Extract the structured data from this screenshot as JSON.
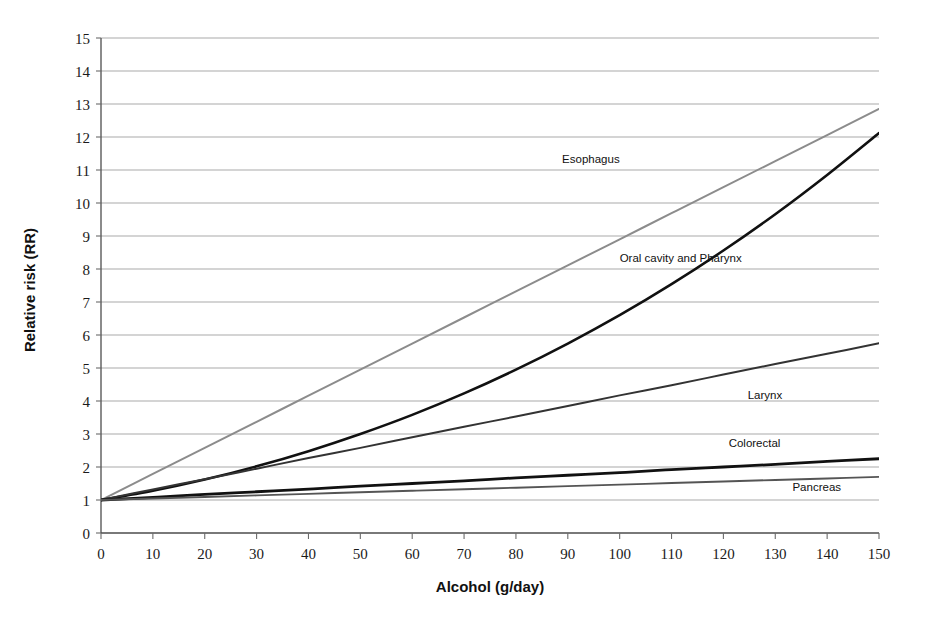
{
  "chart_data": {
    "type": "line",
    "title": "",
    "xlabel": "Alcohol (g/day)",
    "ylabel": "Relative risk (RR)",
    "xlim": [
      0,
      150
    ],
    "ylim": [
      0,
      15
    ],
    "xticks": [
      "0",
      "10",
      "20",
      "30",
      "40",
      "50",
      "60",
      "70",
      "80",
      "90",
      "100",
      "110",
      "120",
      "130",
      "140",
      "150"
    ],
    "yticks": [
      "0",
      "1",
      "2",
      "3",
      "4",
      "5",
      "6",
      "7",
      "8",
      "9",
      "10",
      "11",
      "12",
      "13",
      "14",
      "15"
    ],
    "grid": "horizontal",
    "legend_position": "inline-labels",
    "x": [
      0,
      10,
      20,
      30,
      40,
      50,
      60,
      70,
      80,
      90,
      100,
      110,
      120,
      130,
      140,
      150
    ],
    "series": [
      {
        "name": "Esophagus",
        "color": "#8c8c8c",
        "width": 2.0,
        "label_x": 100,
        "label_y": 11.2,
        "label_anchor": "end",
        "values": [
          1.0,
          1.79,
          2.58,
          3.37,
          4.16,
          4.95,
          5.74,
          6.53,
          7.32,
          8.11,
          8.9,
          9.69,
          10.48,
          11.27,
          12.06,
          12.85
        ]
      },
      {
        "name": "Oral cavity and Pharynx",
        "color": "#111111",
        "width": 2.6,
        "label_x": 100,
        "label_y": 8.2,
        "label_anchor": "start",
        "values": [
          1.0,
          1.28,
          1.62,
          2.02,
          2.48,
          3.0,
          3.58,
          4.23,
          4.95,
          5.74,
          6.6,
          7.54,
          8.56,
          9.66,
          10.85,
          12.12
        ]
      },
      {
        "name": "Larynx",
        "color": "#333333",
        "width": 2.0,
        "label_x": 128,
        "label_y": 4.05,
        "label_anchor": "middle",
        "values": [
          1.0,
          1.32,
          1.63,
          1.95,
          2.27,
          2.58,
          2.9,
          3.22,
          3.53,
          3.85,
          4.17,
          4.48,
          4.8,
          5.12,
          5.43,
          5.75
        ]
      },
      {
        "name": "Colorectal",
        "color": "#111111",
        "width": 2.8,
        "label_x": 126,
        "label_y": 2.6,
        "label_anchor": "middle",
        "values": [
          1.0,
          1.08,
          1.17,
          1.25,
          1.33,
          1.42,
          1.5,
          1.58,
          1.67,
          1.75,
          1.83,
          1.92,
          2.0,
          2.08,
          2.17,
          2.25
        ]
      },
      {
        "name": "Pancreas",
        "color": "#555555",
        "width": 1.9,
        "label_x": 138,
        "label_y": 1.28,
        "label_anchor": "middle",
        "values": [
          1.0,
          1.047,
          1.093,
          1.14,
          1.187,
          1.233,
          1.28,
          1.327,
          1.373,
          1.42,
          1.467,
          1.513,
          1.56,
          1.607,
          1.653,
          1.7
        ]
      }
    ]
  },
  "plot": {
    "left_px": 101,
    "right_px": 879,
    "top_px": 38,
    "bottom_px": 533
  }
}
